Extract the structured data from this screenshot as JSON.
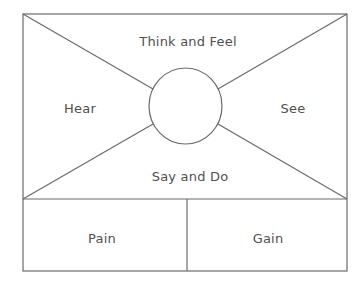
{
  "diagram": {
    "type": "empathy-map",
    "colors": {
      "line": "#6a6a6a",
      "text": "#505050",
      "background": "#ffffff"
    },
    "quadrants": {
      "top": {
        "label": "Think and Feel"
      },
      "left": {
        "label": "Hear"
      },
      "right": {
        "label": "See"
      },
      "bottom": {
        "label": "Say and Do"
      }
    },
    "center": {
      "label": ""
    },
    "bottom_row": {
      "left": {
        "label": "Pain"
      },
      "right": {
        "label": "Gain"
      }
    }
  }
}
